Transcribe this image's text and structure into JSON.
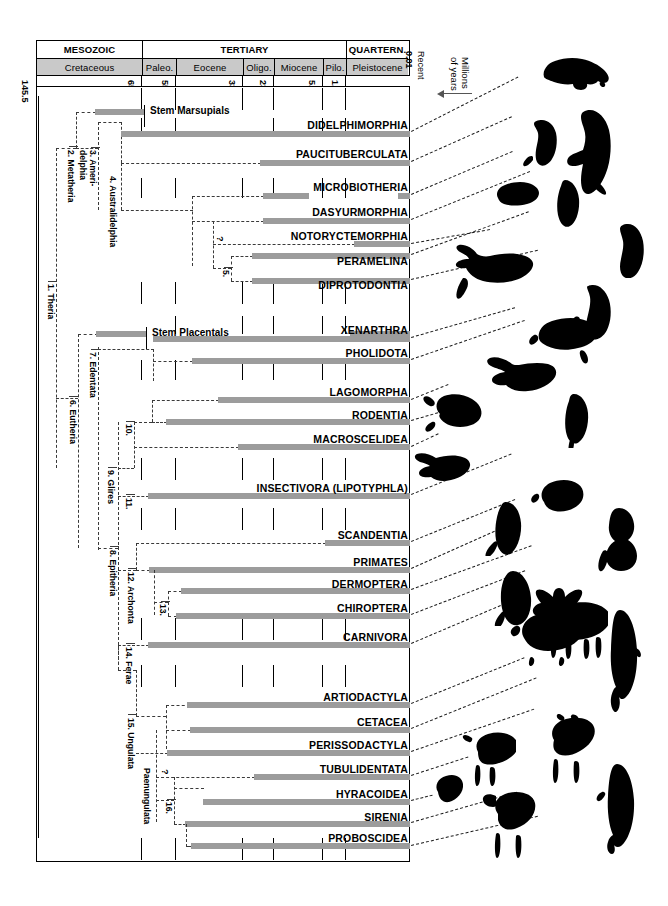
{
  "figure": {
    "axis_label_line1": "Millions",
    "axis_label_line2": "of years",
    "recent_label": "Recent",
    "recent_value": "0.01",
    "bar_color": "#9c9c9c",
    "period_fill": "#c9c9c9"
  },
  "timescale": {
    "eras": [
      {
        "label": "MESOZOIC",
        "start_ma": 145.5,
        "end_ma": 65.0
      },
      {
        "label": "TERTIARY",
        "start_ma": 65.0,
        "end_ma": 1.7
      },
      {
        "label": "QUARTERN.",
        "start_ma": 1.7,
        "end_ma": 0.0
      }
    ],
    "periods": [
      {
        "label": "Cretaceous",
        "start_ma": 145.5,
        "end_ma": 65.0
      },
      {
        "label": "Paleo.",
        "start_ma": 65.0,
        "end_ma": 55.0
      },
      {
        "label": "Eocene",
        "start_ma": 55.0,
        "end_ma": 33.4
      },
      {
        "label": "Oligo.",
        "start_ma": 33.4,
        "end_ma": 23.0
      },
      {
        "label": "Miocene",
        "start_ma": 23.0,
        "end_ma": 5.2
      },
      {
        "label": "Pilo.",
        "start_ma": 5.2,
        "end_ma": 1.7
      },
      {
        "label": "Pleistocene",
        "start_ma": 1.7,
        "end_ma": 0.0
      }
    ],
    "ticks": [
      "145.5",
      "65.0",
      "55.0",
      "33.4",
      "23.0",
      "5.2",
      "1.7",
      "0.01"
    ]
  },
  "stem_labels": [
    {
      "id": "stem-marsupials",
      "label": "Stem Marsupials"
    },
    {
      "id": "stem-placentals",
      "label": "Stem Placentals"
    }
  ],
  "taxa": [
    {
      "id": "didelphimorphia",
      "label": "DIDELPHIMORPHIA"
    },
    {
      "id": "paucituberculata",
      "label": "PAUCITUBERCULATA"
    },
    {
      "id": "microbiotheria",
      "label": "MICROBIOTHERIA"
    },
    {
      "id": "dasyurmorphia",
      "label": "DASYURMORPHIA"
    },
    {
      "id": "notoryctemorphia",
      "label": "NOTORYCTEMORPHIA"
    },
    {
      "id": "peramelina",
      "label": "PERAMELINA"
    },
    {
      "id": "diprotodontia",
      "label": "DIPROTODONTIA"
    },
    {
      "id": "xenarthra",
      "label": "XENARTHRA"
    },
    {
      "id": "pholidota",
      "label": "PHOLIDOTA"
    },
    {
      "id": "lagomorpha",
      "label": "LAGOMORPHA"
    },
    {
      "id": "rodentia",
      "label": "RODENTIA"
    },
    {
      "id": "macroscelidea",
      "label": "MACROSCELIDEA"
    },
    {
      "id": "insectivora",
      "label": "INSECTIVORA (LIPOTYPHLA)"
    },
    {
      "id": "scandentia",
      "label": "SCANDENTIA"
    },
    {
      "id": "primates",
      "label": "PRIMATES"
    },
    {
      "id": "dermoptera",
      "label": "DERMOPTERA"
    },
    {
      "id": "chiroptera",
      "label": "CHIROPTERA"
    },
    {
      "id": "carnivora",
      "label": "CARNIVORA"
    },
    {
      "id": "artiodactyla",
      "label": "ARTIODACTYLA"
    },
    {
      "id": "cetacea",
      "label": "CETACEA"
    },
    {
      "id": "perissodactyla",
      "label": "PERISSODACTYLA"
    },
    {
      "id": "tubulidentata",
      "label": "TUBULIDENTATA"
    },
    {
      "id": "hyracoidea",
      "label": "HYRACOIDEA"
    },
    {
      "id": "sirenia",
      "label": "SIRENIA"
    },
    {
      "id": "proboscidea",
      "label": "PROBOSCIDEA"
    }
  ],
  "clade_nodes": [
    {
      "num": "1.",
      "label": "1. Theria"
    },
    {
      "num": "2.",
      "label": "2. Metatheria"
    },
    {
      "num": "3.",
      "label": "3. Ameri-\ndelphia"
    },
    {
      "num": "4.",
      "label": "4. Australidelphia"
    },
    {
      "num": "5.",
      "label": "5."
    },
    {
      "num": "6.",
      "label": "6. Eutheria"
    },
    {
      "num": "7.",
      "label": "7. Edentata"
    },
    {
      "num": "8.",
      "label": "8. Epitheria"
    },
    {
      "num": "9.",
      "label": "9. Glires"
    },
    {
      "num": "10.",
      "label": "10."
    },
    {
      "num": "11.",
      "label": "11."
    },
    {
      "num": "12.",
      "label": "12. Archonta"
    },
    {
      "num": "13.",
      "label": "13."
    },
    {
      "num": "14.",
      "label": "14. Ferae"
    },
    {
      "num": "15.",
      "label": "15. Ungulata"
    },
    {
      "num": "16.",
      "label": "16."
    },
    {
      "num": "P",
      "label": "Paenungulata"
    }
  ],
  "uncertainty_marks": [
    {
      "id": "q-notoryctemorphia",
      "label": "?"
    },
    {
      "id": "q-tubulidentata",
      "label": "?"
    }
  ]
}
